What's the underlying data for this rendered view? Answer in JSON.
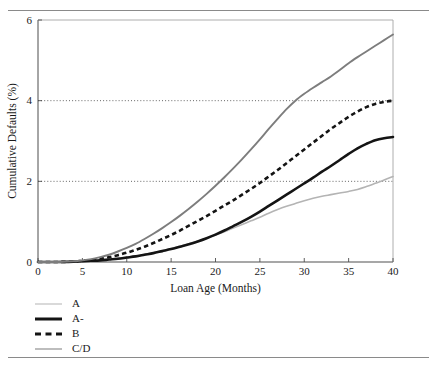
{
  "figure": {
    "top_rule": true,
    "bottom_rule": true,
    "rule_color": "#8a8a8a"
  },
  "chart_data": {
    "type": "line",
    "title": "",
    "xlabel": "Loan Age (Months)",
    "ylabel": "Cumulative Defaults (%)",
    "xlim": [
      0,
      40
    ],
    "ylim": [
      0,
      6
    ],
    "xticks": [
      0,
      5,
      10,
      15,
      20,
      25,
      30,
      35,
      40
    ],
    "yticks": [
      0,
      2,
      4,
      6
    ],
    "xtick_labels": [
      "0",
      "5",
      "10",
      "15",
      "20",
      "25",
      "30",
      "35",
      "40"
    ],
    "ytick_labels": [
      "0",
      "2",
      "4",
      "6"
    ],
    "grid": "horizontal-dotted-at-2-and-4",
    "legend_position": "below-left",
    "x": [
      0,
      2,
      4,
      5,
      6,
      7,
      8,
      9,
      10,
      11,
      12,
      13,
      14,
      15,
      16,
      17,
      18,
      19,
      20,
      21,
      22,
      23,
      24,
      25,
      26,
      27,
      28,
      29,
      30,
      31,
      32,
      33,
      34,
      35,
      36,
      37,
      38,
      39,
      40
    ],
    "series": [
      {
        "name": "A",
        "color": "#b4b4b4",
        "style": "solid",
        "width": 1.6,
        "values": [
          0,
          0,
          0.01,
          0.02,
          0.03,
          0.05,
          0.07,
          0.09,
          0.12,
          0.15,
          0.19,
          0.23,
          0.28,
          0.33,
          0.39,
          0.45,
          0.52,
          0.59,
          0.67,
          0.75,
          0.84,
          0.93,
          1.02,
          1.11,
          1.21,
          1.3,
          1.38,
          1.45,
          1.52,
          1.58,
          1.63,
          1.67,
          1.71,
          1.75,
          1.8,
          1.87,
          1.95,
          2.03,
          2.12
        ]
      },
      {
        "name": "A-",
        "color": "#141414",
        "style": "solid",
        "width": 2.6,
        "values": [
          0,
          0,
          0.01,
          0.02,
          0.03,
          0.04,
          0.06,
          0.08,
          0.11,
          0.14,
          0.18,
          0.22,
          0.27,
          0.32,
          0.38,
          0.44,
          0.51,
          0.59,
          0.68,
          0.78,
          0.89,
          1.0,
          1.12,
          1.25,
          1.39,
          1.53,
          1.67,
          1.81,
          1.95,
          2.09,
          2.24,
          2.38,
          2.53,
          2.68,
          2.82,
          2.93,
          3.02,
          3.07,
          3.1
        ]
      },
      {
        "name": "B",
        "color": "#141414",
        "style": "dashed",
        "width": 2.6,
        "values": [
          0,
          0,
          0.01,
          0.03,
          0.05,
          0.08,
          0.12,
          0.17,
          0.23,
          0.3,
          0.38,
          0.47,
          0.57,
          0.67,
          0.78,
          0.9,
          1.02,
          1.14,
          1.27,
          1.4,
          1.53,
          1.67,
          1.81,
          1.96,
          2.12,
          2.28,
          2.45,
          2.62,
          2.79,
          2.96,
          3.13,
          3.3,
          3.45,
          3.6,
          3.73,
          3.84,
          3.92,
          3.97,
          4.0
        ]
      },
      {
        "name": "C/D",
        "color": "#7d7d7d",
        "style": "solid",
        "width": 1.9,
        "values": [
          0,
          0,
          0.02,
          0.04,
          0.07,
          0.12,
          0.18,
          0.26,
          0.35,
          0.45,
          0.57,
          0.7,
          0.84,
          0.99,
          1.15,
          1.32,
          1.5,
          1.69,
          1.89,
          2.1,
          2.32,
          2.55,
          2.79,
          3.04,
          3.3,
          3.55,
          3.79,
          4.0,
          4.17,
          4.32,
          4.46,
          4.6,
          4.76,
          4.93,
          5.08,
          5.22,
          5.36,
          5.5,
          5.64
        ]
      }
    ]
  },
  "legend": {
    "items": [
      {
        "label": "A"
      },
      {
        "label": "A-"
      },
      {
        "label": "B"
      },
      {
        "label": "C/D"
      }
    ]
  }
}
